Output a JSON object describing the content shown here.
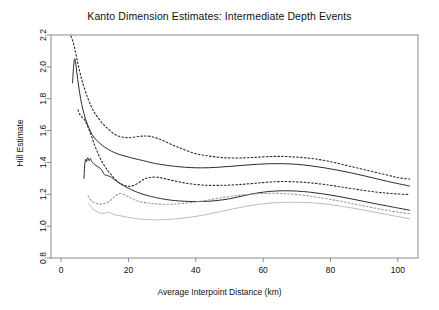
{
  "chart_data": {
    "type": "line",
    "title": "Kanto Dimension Estimates: Intermediate Depth Events",
    "xlabel": "Average Interpoint Distance (km)",
    "ylabel": "Hill Estimate",
    "xlim": [
      -3,
      106
    ],
    "ylim": [
      0.8,
      2.2
    ],
    "xticks": [
      0,
      20,
      40,
      60,
      80,
      100
    ],
    "xtick_labels": [
      "0",
      "20",
      "40",
      "60",
      "80",
      "100"
    ],
    "yticks": [
      0.8,
      1.0,
      1.2,
      1.4,
      1.6,
      1.8,
      2.0,
      2.2
    ],
    "ytick_labels": [
      "0.8",
      "1.0",
      "1.2",
      "1.4",
      "1.6",
      "1.8",
      "2.0",
      "2.2"
    ],
    "grid": false,
    "legend": "none",
    "colors": {
      "dark": "#2b2b2b",
      "gray": "#b8b8b8",
      "frame": "#8a8a8a",
      "background": "#ffffff"
    },
    "series": [
      {
        "name": "upper-dashed-band",
        "style": "dashed",
        "color": "#2b2b2b",
        "x": [
          2.2,
          3.0,
          4.0,
          5.0,
          6.0,
          7.0,
          8.0,
          9.0,
          10.0,
          11.0,
          12.5,
          14.0,
          16.0,
          18.0,
          20.0,
          22.0,
          24.0,
          26.0,
          28.0,
          30.0,
          33.0,
          36.0,
          40.0,
          44.0,
          48.0,
          52.0,
          56.0,
          60.0,
          64.0,
          68.0,
          72.0,
          76.0,
          80.0,
          84.0,
          88.0,
          92.0,
          96.0,
          100.0,
          103.5
        ],
        "y": [
          2.21,
          2.19,
          2.12,
          2.02,
          1.93,
          1.86,
          1.8,
          1.75,
          1.71,
          1.68,
          1.64,
          1.61,
          1.575,
          1.56,
          1.555,
          1.56,
          1.565,
          1.565,
          1.555,
          1.54,
          1.51,
          1.485,
          1.455,
          1.44,
          1.43,
          1.428,
          1.43,
          1.435,
          1.438,
          1.436,
          1.43,
          1.42,
          1.405,
          1.385,
          1.365,
          1.345,
          1.325,
          1.305,
          1.295
        ]
      },
      {
        "name": "upper-solid-curve",
        "style": "solid",
        "color": "#2b2b2b",
        "x": [
          3.4,
          3.7,
          4.0,
          4.3,
          4.7,
          5.2,
          5.8,
          6.5,
          7.3,
          8.2,
          9.2,
          10.3,
          11.5,
          13.0,
          15.0,
          17.0,
          19.0,
          21.0,
          23.0,
          25.0,
          28.0,
          31.0,
          34.0,
          38.0,
          42.0,
          46.0,
          50.0,
          54.0,
          58.0,
          62.0,
          66.0,
          70.0,
          74.0,
          78.0,
          82.0,
          86.0,
          90.0,
          94.0,
          98.0,
          103.5
        ],
        "y": [
          1.9,
          2.0,
          2.05,
          2.03,
          1.96,
          1.88,
          1.8,
          1.73,
          1.67,
          1.62,
          1.575,
          1.545,
          1.52,
          1.495,
          1.47,
          1.452,
          1.44,
          1.428,
          1.418,
          1.408,
          1.393,
          1.383,
          1.375,
          1.368,
          1.366,
          1.369,
          1.375,
          1.382,
          1.388,
          1.392,
          1.392,
          1.388,
          1.379,
          1.367,
          1.352,
          1.335,
          1.316,
          1.296,
          1.276,
          1.252
        ]
      },
      {
        "name": "middle-dashed-band",
        "style": "dashed",
        "color": "#2b2b2b",
        "x": [
          5.0,
          5.6,
          6.2,
          6.9,
          7.6,
          8.4,
          9.2,
          10.0,
          11.0,
          12.0,
          13.0,
          14.0,
          15.0,
          16.0,
          17.0,
          18.5,
          20.0,
          21.5,
          23.0,
          24.5,
          26.0,
          28.0,
          30.0,
          32.0,
          35.0,
          38.0,
          42.0,
          46.0,
          50.0,
          54.0,
          58.0,
          62.0,
          66.0,
          70.0,
          74.0,
          78.0,
          82.0,
          86.0,
          90.0,
          94.0,
          98.0,
          103.5
        ],
        "y": [
          1.73,
          1.7,
          1.685,
          1.67,
          1.64,
          1.6,
          1.555,
          1.505,
          1.455,
          1.41,
          1.375,
          1.345,
          1.32,
          1.295,
          1.275,
          1.258,
          1.25,
          1.255,
          1.272,
          1.293,
          1.305,
          1.308,
          1.302,
          1.292,
          1.278,
          1.267,
          1.258,
          1.256,
          1.258,
          1.263,
          1.27,
          1.277,
          1.28,
          1.278,
          1.272,
          1.262,
          1.25,
          1.237,
          1.224,
          1.213,
          1.205,
          1.198
        ]
      },
      {
        "name": "lower-solid-curve",
        "style": "solid",
        "color": "#2b2b2b",
        "x": [
          6.8,
          7.0,
          7.3,
          7.6,
          7.9,
          8.3,
          8.7,
          9.1,
          9.6,
          10.1,
          10.7,
          11.3,
          12.0,
          12.8,
          13.6,
          14.5,
          15.5,
          16.5,
          17.5,
          18.5,
          20.0,
          22.0,
          24.0,
          26.0,
          28.0,
          31.0,
          34.0,
          38.0,
          42.0,
          46.0,
          50.0,
          54.0,
          58.0,
          62.0,
          66.0,
          70.0,
          74.0,
          78.0,
          82.0,
          86.0,
          90.0,
          94.0,
          98.0,
          103.5
        ],
        "y": [
          1.3,
          1.38,
          1.42,
          1.405,
          1.43,
          1.41,
          1.425,
          1.405,
          1.395,
          1.385,
          1.375,
          1.368,
          1.355,
          1.325,
          1.318,
          1.312,
          1.298,
          1.282,
          1.268,
          1.255,
          1.238,
          1.218,
          1.202,
          1.19,
          1.18,
          1.168,
          1.16,
          1.155,
          1.155,
          1.16,
          1.172,
          1.19,
          1.207,
          1.218,
          1.222,
          1.22,
          1.213,
          1.202,
          1.188,
          1.172,
          1.155,
          1.138,
          1.122,
          1.1
        ]
      },
      {
        "name": "lower-dashed-band",
        "style": "dashed",
        "color": "#9a9a9a",
        "x": [
          8.0,
          8.5,
          9.0,
          9.6,
          10.2,
          10.8,
          11.5,
          12.2,
          13.0,
          13.8,
          14.6,
          15.5,
          16.5,
          17.5,
          18.5,
          19.5,
          20.5,
          21.5,
          22.5,
          24.0,
          26.0,
          28.0,
          30.0,
          33.0,
          36.0,
          40.0,
          44.0,
          48.0,
          52.0,
          56.0,
          60.0,
          64.0,
          68.0,
          72.0,
          76.0,
          80.0,
          84.0,
          88.0,
          92.0,
          96.0,
          100.0,
          103.5
        ],
        "y": [
          1.19,
          1.175,
          1.16,
          1.15,
          1.145,
          1.14,
          1.138,
          1.14,
          1.142,
          1.148,
          1.16,
          1.178,
          1.195,
          1.205,
          1.2,
          1.19,
          1.178,
          1.168,
          1.16,
          1.152,
          1.145,
          1.14,
          1.138,
          1.138,
          1.142,
          1.152,
          1.165,
          1.18,
          1.192,
          1.2,
          1.205,
          1.206,
          1.202,
          1.194,
          1.182,
          1.168,
          1.152,
          1.135,
          1.118,
          1.102,
          1.088,
          1.078
        ]
      },
      {
        "name": "gray-solid-curve",
        "style": "solid",
        "color": "#bcbcbc",
        "x": [
          8.2,
          8.7,
          9.2,
          9.8,
          10.4,
          11.0,
          11.7,
          12.4,
          13.2,
          14.0,
          14.9,
          15.8,
          16.8,
          17.8,
          18.8,
          20.0,
          21.5,
          23.0,
          25.0,
          27.0,
          29.0,
          32.0,
          35.0,
          39.0,
          43.0,
          47.0,
          51.0,
          55.0,
          59.0,
          63.0,
          67.0,
          71.0,
          75.0,
          79.0,
          83.0,
          87.0,
          91.0,
          95.0,
          99.0,
          103.5
        ],
        "y": [
          1.14,
          1.125,
          1.112,
          1.102,
          1.095,
          1.088,
          1.082,
          1.08,
          1.082,
          1.088,
          1.082,
          1.072,
          1.068,
          1.064,
          1.06,
          1.055,
          1.05,
          1.046,
          1.042,
          1.04,
          1.04,
          1.042,
          1.048,
          1.058,
          1.072,
          1.09,
          1.108,
          1.125,
          1.138,
          1.146,
          1.15,
          1.15,
          1.146,
          1.138,
          1.126,
          1.112,
          1.096,
          1.08,
          1.064,
          1.046
        ]
      }
    ]
  }
}
